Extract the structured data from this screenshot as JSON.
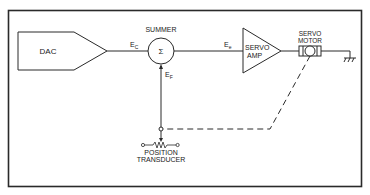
{
  "diagram": {
    "blocks": {
      "dac": "DAC",
      "summer_title": "SUMMER",
      "summer_symbol": "Σ",
      "servo_amp_line1": "SERVO",
      "servo_amp_line2": "AMP",
      "servo_motor_line1": "SERVO",
      "servo_motor_line2": "MOTOR",
      "transducer_line1": "POSITION",
      "transducer_line2": "TRANSDUCER"
    },
    "signals": {
      "ec_main": "E",
      "ec_sub": "C",
      "ef_main": "E",
      "ef_sub": "F",
      "ee_main": "E",
      "ee_sub": "e"
    },
    "colors": {
      "line": "#2a2a2a",
      "background": "#ffffff"
    }
  }
}
